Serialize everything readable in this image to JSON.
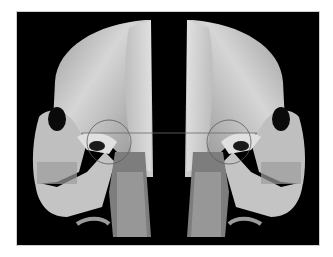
{
  "image": {
    "description": "Paired mirrored 3D CT volume renderings of a human skull in lateral view (left and right sides), with cervical spine, on black background",
    "background_color": "#000000",
    "bone_color": "#c8c8c8",
    "panels": [
      {
        "side": "left",
        "facing": "left"
      },
      {
        "side": "right",
        "facing": "right"
      }
    ],
    "overlays": {
      "horizontal_reference_line": true,
      "circles_around_condyle": 2
    }
  }
}
